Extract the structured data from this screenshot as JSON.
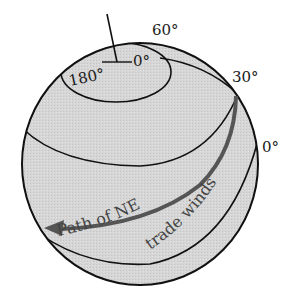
{
  "diagram": {
    "labels": {
      "lat60": "60°",
      "lat30": "30°",
      "lat0": "0°",
      "lon180": "180°",
      "lon0": "0°",
      "path_text_1": "Path of NE",
      "path_text_2": "trade winds"
    },
    "colors": {
      "globe_fill": "#d4d4d4",
      "outline": "#111111",
      "path_arrow": "#555555",
      "text": "#1a1a1a"
    }
  }
}
